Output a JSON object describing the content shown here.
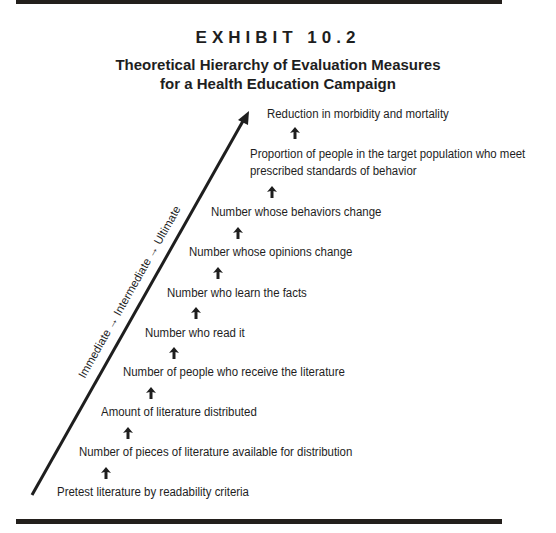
{
  "header": {
    "exhibit": "EXHIBIT 10.2",
    "title_line1": "Theoretical Hierarchy of Evaluation Measures",
    "title_line2": "for a Health Education Campaign"
  },
  "axis": {
    "label": "Immediate → Intermediate → Ultimate",
    "arrow_icon": "diagonal-up-arrow"
  },
  "levels": [
    {
      "label": "Reduction in morbidity and mortality"
    },
    {
      "label": "Proportion of people in the target population who meet",
      "label2": "prescribed standards of behavior"
    },
    {
      "label": "Number whose behaviors change"
    },
    {
      "label": "Number whose opinions change"
    },
    {
      "label": "Number who learn the facts"
    },
    {
      "label": "Number who read it"
    },
    {
      "label": "Number of people who receive the literature"
    },
    {
      "label": "Amount of literature distributed"
    },
    {
      "label": "Number of pieces of literature available for distribution"
    },
    {
      "label": "Pretest literature by readability criteria"
    }
  ],
  "connector_icon": "up-arrow",
  "colors": {
    "ink": "#1e1e1e",
    "rule": "#231f1c",
    "background": "#ffffff"
  }
}
